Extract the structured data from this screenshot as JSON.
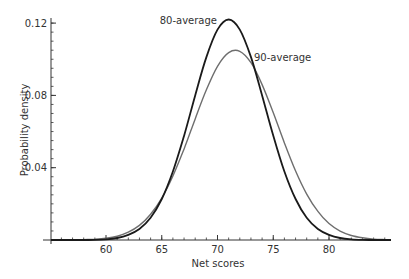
{
  "chart_data": {
    "type": "line",
    "title": "",
    "xlabel": "Net scores",
    "ylabel": "Probability density",
    "xlim": [
      55.07,
      85.56
    ],
    "ylim": [
      0,
      0.125
    ],
    "x_ticks": [
      60,
      65,
      70,
      75,
      80
    ],
    "x_tick_labels": [
      "60",
      "65",
      "70",
      "75",
      "80"
    ],
    "x_minor_step": 1,
    "y_ticks": [
      0.04,
      0.08,
      0.12
    ],
    "y_tick_labels": [
      "0.04",
      "0.08",
      "0.12"
    ],
    "y_minor_step": 0.005,
    "grid": false,
    "legend": "inline labels",
    "x": [
      56,
      57,
      58,
      59,
      60,
      61,
      62,
      63,
      64,
      65,
      66,
      67,
      68,
      69,
      70,
      71,
      72,
      73,
      74,
      75,
      76,
      77,
      78,
      79,
      80,
      81,
      82,
      83,
      84,
      85
    ],
    "series": [
      {
        "name": "80-average",
        "color": "#1a1a1a",
        "values": [
          0.0,
          0.0,
          0.0,
          0.0001,
          0.0004,
          0.0011,
          0.0028,
          0.0061,
          0.0123,
          0.0227,
          0.0379,
          0.0577,
          0.08,
          0.1012,
          0.1164,
          0.122,
          0.1164,
          0.1012,
          0.08,
          0.0577,
          0.0379,
          0.0227,
          0.0123,
          0.0061,
          0.0028,
          0.0011,
          0.0004,
          0.0001,
          0.0,
          0.0
        ],
        "label_x": 217,
        "label_y": 24
      },
      {
        "name": "90-average",
        "color": "#6e6e6e",
        "values": [
          0.0,
          0.0001,
          0.0002,
          0.0004,
          0.001,
          0.0021,
          0.0043,
          0.0081,
          0.0142,
          0.0232,
          0.0354,
          0.0504,
          0.067,
          0.0831,
          0.0961,
          0.1037,
          0.1044,
          0.0981,
          0.086,
          0.0704,
          0.0537,
          0.0382,
          0.0254,
          0.0158,
          0.0091,
          0.0049,
          0.0025,
          0.0012,
          0.0005,
          0.0002
        ],
        "label_x": 254,
        "label_y": 61
      }
    ]
  }
}
